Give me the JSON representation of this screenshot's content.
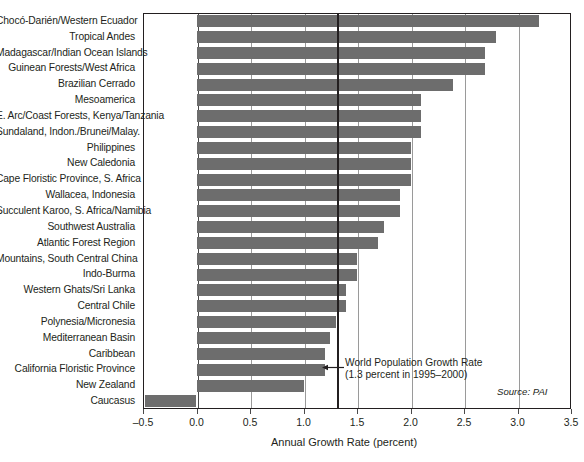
{
  "chart_data": {
    "type": "bar",
    "orientation": "horizontal",
    "title": "",
    "xlabel": "Annual Growth Rate (percent)",
    "ylabel": "",
    "xlim": [
      -0.5,
      3.5
    ],
    "grid": true,
    "legend": null,
    "source": "Source: PAI",
    "xticks": [
      {
        "value": -0.5,
        "label": "–0.5"
      },
      {
        "value": 0.0,
        "label": "0.0"
      },
      {
        "value": 0.5,
        "label": "0.5"
      },
      {
        "value": 1.0,
        "label": "1.0"
      },
      {
        "value": 1.5,
        "label": "1.5"
      },
      {
        "value": 2.0,
        "label": "2.0"
      },
      {
        "value": 2.5,
        "label": "2.5"
      },
      {
        "value": 3.0,
        "label": "3.0"
      },
      {
        "value": 3.5,
        "label": "3.5"
      }
    ],
    "reference_line": {
      "value": 1.3,
      "label_line1": "World Population Growth Rate",
      "label_line2": "(1.3 percent in 1995–2000)"
    },
    "categories": [
      "Chocó-Darién/Western Ecuador",
      "Tropical Andes",
      "Madagascar/Indian Ocean Islands",
      "Guinean Forests/West Africa",
      "Brazilian Cerrado",
      "Mesoamerica",
      "E. Arc/Coast Forests, Kenya/Tanzania",
      "Sundaland, Indon./Brunei/Malay.",
      "Philippines",
      "New Caledonia",
      "Cape Floristic Province, S. Africa",
      "Wallacea, Indonesia",
      "Succulent Karoo, S. Africa/Namibia",
      "Southwest Australia",
      "Atlantic Forest Region",
      "Mountains, South Central China",
      "Indo-Burma",
      "Western Ghats/Sri Lanka",
      "Central Chile",
      "Polynesia/Micronesia",
      "Mediterranean Basin",
      "Caribbean",
      "California Floristic Province",
      "New Zealand",
      "Caucasus"
    ],
    "values": [
      3.2,
      2.8,
      2.7,
      2.7,
      2.4,
      2.1,
      2.1,
      2.1,
      2.0,
      2.0,
      2.0,
      1.9,
      1.9,
      1.75,
      1.7,
      1.5,
      1.5,
      1.4,
      1.4,
      1.3,
      1.25,
      1.2,
      1.2,
      1.0,
      -0.48
    ]
  }
}
